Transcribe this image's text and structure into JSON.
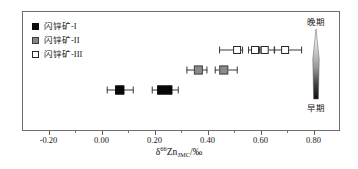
{
  "chart_data": {
    "type": "scatter",
    "title": "",
    "xlabel": "δ66ZnJMC/‰",
    "ylabel": "",
    "xlim": [
      -0.3,
      0.9
    ],
    "ylim": [
      0,
      3
    ],
    "grid": false,
    "xticks": [
      -0.2,
      0.0,
      0.2,
      0.4,
      0.6,
      0.8
    ],
    "xtick_labels": [
      "-0.20",
      "0.00",
      "0.20",
      "0.40",
      "0.60",
      "0.80"
    ],
    "minor_ticks": [
      -0.1,
      0.1,
      0.3,
      0.5,
      0.7
    ],
    "orientation": "horizontal-error-bars",
    "legend_position": "top-left",
    "series": [
      {
        "name": "闪锌矿-I",
        "marker": "filled-square",
        "color": "#080808",
        "row": 1,
        "points": [
          {
            "x": 0.07,
            "xerr_low": 0.05,
            "xerr_high": 0.05,
            "marker_w": 9,
            "marker_h": 9
          },
          {
            "x": 0.24,
            "xerr_low": 0.05,
            "xerr_high": 0.05,
            "marker_w": 15,
            "marker_h": 9
          }
        ]
      },
      {
        "name": "闪锌矿-II",
        "marker": "gray-square",
        "color": "#8a8a8a",
        "row": 2,
        "points": [
          {
            "x": 0.36,
            "xerr_low": 0.045,
            "xerr_high": 0.035,
            "marker_w": 9,
            "marker_h": 9
          },
          {
            "x": 0.47,
            "xerr_low": 0.035,
            "xerr_high": 0.05,
            "marker_w": 9,
            "marker_h": 9
          }
        ]
      },
      {
        "name": "闪锌矿-III",
        "marker": "open-square",
        "color": "#ffffff",
        "row": 3,
        "points": [
          {
            "x": 0.49,
            "xerr_low": 0.065,
            "xerr_high": 0.025,
            "marker_w": 8,
            "marker_h": 8
          },
          {
            "x": 0.575,
            "xerr_low": 0.025,
            "xerr_high": 0.02,
            "marker_w": 8,
            "marker_h": 8
          },
          {
            "x": 0.625,
            "xerr_low": 0.02,
            "xerr_high": 0.035,
            "marker_w": 8,
            "marker_h": 8
          },
          {
            "x": 0.705,
            "xerr_low": 0.04,
            "xerr_high": 0.065,
            "marker_w": 8,
            "marker_h": 8
          }
        ]
      }
    ],
    "annotations": [
      {
        "text": "晚期",
        "position": "right-top"
      },
      {
        "text": "早期",
        "position": "right-bottom"
      }
    ]
  },
  "legend": {
    "items": [
      {
        "label": "闪锌矿-I",
        "swatch": "filled-square"
      },
      {
        "label": "闪锌矿-II",
        "swatch": "gray-square"
      },
      {
        "label": "闪锌矿-III",
        "swatch": "open-square"
      }
    ]
  },
  "axis": {
    "title_delta": "δ",
    "title_sup": "66",
    "title_element": "Zn",
    "title_sub": "JMC",
    "title_unit": "/‰"
  },
  "stage": {
    "late_label": "晚期",
    "early_label": "早期"
  },
  "colors": {
    "frame": "#6e6e6e",
    "type_i": "#080808",
    "type_ii": "#8a8a8a",
    "type_iii": "#ffffff",
    "error_bar": "#3b3b3b",
    "text": "#161616"
  }
}
